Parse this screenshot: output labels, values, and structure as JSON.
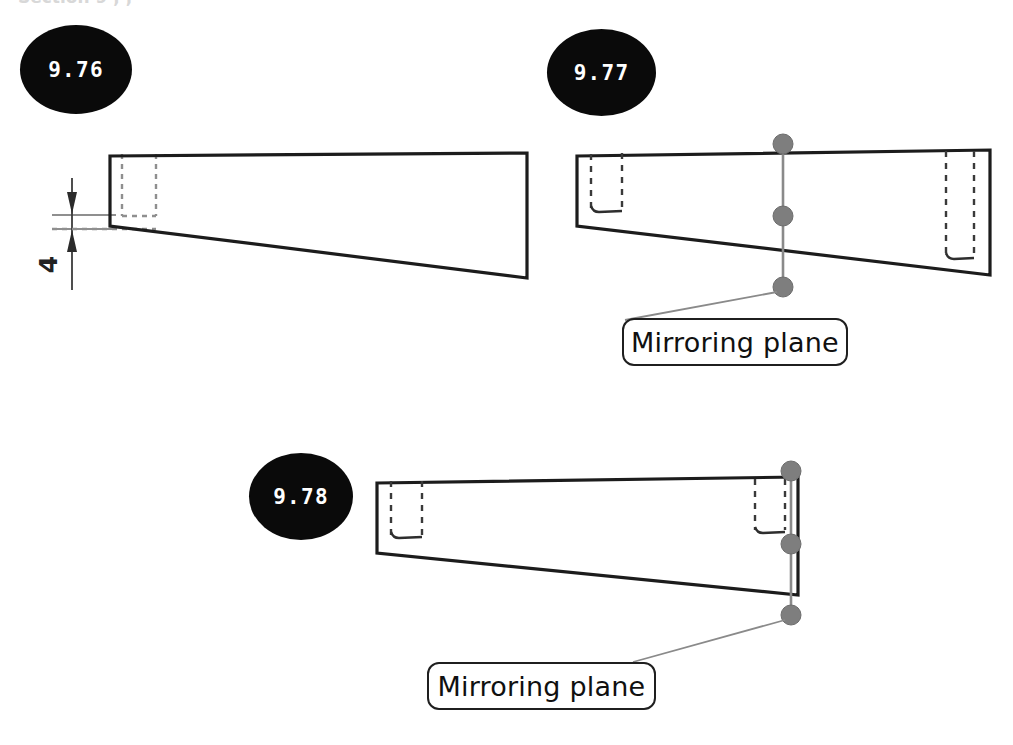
{
  "page": {
    "width": 1013,
    "height": 745,
    "background": "#ffffff",
    "scan_remnant_text": "Section 9 , ,"
  },
  "colors": {
    "badge_fill": "#0a0a0a",
    "badge_text": "#ffffff",
    "solid_edge": "#1c1c1c",
    "hidden_edge": "#8f8f8f",
    "plane_line": "#8a8a8a",
    "plane_handle": "#7e7e7e",
    "callout_border": "#1f1f1f",
    "callout_text": "#101010",
    "dimension": "#3b3b3b"
  },
  "figures": [
    {
      "id": "9-76",
      "number": "9.76",
      "caption": null,
      "dimension_label": "4",
      "annotations": [],
      "features": [
        "tapered-block-profile",
        "hidden-slot-left",
        "vertical-dimension-4"
      ]
    },
    {
      "id": "9-77",
      "number": "9.77",
      "caption": null,
      "dimension_label": null,
      "annotations": [
        {
          "name": "mirroring-plane-callout",
          "text": "Mirroring plane"
        }
      ],
      "features": [
        "tapered-block-profile",
        "hidden-slot-left",
        "hidden-slot-right-deep",
        "mirroring-plane-line",
        "plane-handles-3"
      ]
    },
    {
      "id": "9-78",
      "number": "9.78",
      "caption": null,
      "dimension_label": null,
      "annotations": [
        {
          "name": "mirroring-plane-callout",
          "text": "Mirroring plane"
        }
      ],
      "features": [
        "tapered-block-profile",
        "hidden-slot-left",
        "hidden-slot-right",
        "mirroring-plane-line",
        "plane-handles-3"
      ]
    }
  ]
}
